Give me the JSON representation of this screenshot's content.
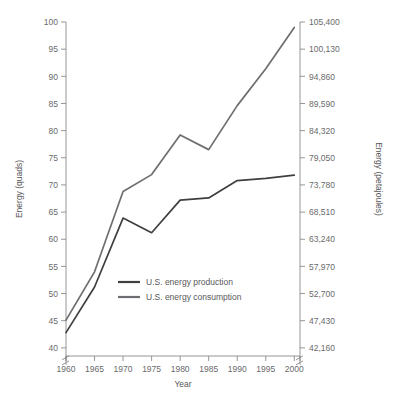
{
  "chart_data": {
    "type": "line",
    "title": "",
    "xlabel": "Year",
    "ylabel": "Energy (quads)",
    "ylabel_right": "Energy (petajoules)",
    "x": [
      1960,
      1965,
      1970,
      1975,
      1980,
      1985,
      1990,
      1995,
      2000
    ],
    "xlim": [
      1960,
      2001
    ],
    "ylim": [
      38.5,
      100
    ],
    "y_axis_break": true,
    "grid": false,
    "legend_position": "inside-lower-center",
    "xticks": [
      "1960",
      "1965",
      "1970",
      "1975",
      "1980",
      "1985",
      "1990",
      "1995",
      "2000"
    ],
    "yticks_left": [
      "40",
      "45",
      "50",
      "55",
      "60",
      "65",
      "70",
      "75",
      "80",
      "85",
      "90",
      "95",
      "100"
    ],
    "yticks_right": [
      "42,160",
      "47,430",
      "52,700",
      "57,970",
      "63,240",
      "68,510",
      "73,780",
      "79,050",
      "84,320",
      "89,590",
      "94,860",
      "100,130",
      "105,400"
    ],
    "series": [
      {
        "name": "U.S. energy production",
        "color": "#3f3f42",
        "values": [
          42.8,
          51.2,
          63.9,
          61.2,
          67.2,
          67.6,
          70.8,
          71.2,
          71.8
        ]
      },
      {
        "name": "U.S. energy consumption",
        "color": "#6e6e72",
        "values": [
          45.1,
          54.0,
          68.8,
          71.9,
          79.2,
          76.5,
          84.6,
          91.4,
          99.0
        ]
      }
    ]
  },
  "legend": {
    "items": [
      {
        "label": "U.S. energy production",
        "color": "#3f3f42"
      },
      {
        "label": "U.S. energy consumption",
        "color": "#6e6e72"
      }
    ]
  },
  "axes": {
    "x_title": "Year",
    "y_left_title": "Energy (quads)",
    "y_right_title": "Energy (petajoules)"
  }
}
